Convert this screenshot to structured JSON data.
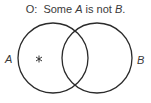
{
  "diagram": {
    "type": "venn",
    "title": {
      "prefix": "O:",
      "word1": "Some",
      "term1": "A",
      "word2": "is not",
      "term2": "B",
      "end": "."
    },
    "sets": [
      {
        "label": "A",
        "cx": 53,
        "cy": 58,
        "r": 35
      },
      {
        "label": "B",
        "cx": 97,
        "cy": 58,
        "r": 35
      }
    ],
    "marker": {
      "symbol": "*",
      "region": "A only",
      "x": 39,
      "y": 59
    },
    "stroke_color": "#2b2b2b"
  }
}
